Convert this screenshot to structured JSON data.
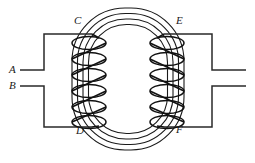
{
  "figure": {
    "type": "electrical-schematic",
    "width": 255,
    "height": 163,
    "background_color": "#ffffff",
    "line_color": "#1a1a1a"
  },
  "labels": {
    "a": "A",
    "b": "B",
    "c": "C",
    "d": "D",
    "e": "E",
    "f": "F"
  },
  "core": {
    "name": "ring-core",
    "ring_count": 4,
    "description": "four nested rounded-rectangle laminations forming a closed magnetic circuit",
    "outer": {
      "x": 72,
      "y": 8,
      "width": 112,
      "height": 142,
      "radius": 52
    },
    "ring_spacing": 5.5
  },
  "coils": {
    "primary": {
      "name": "primary-coil",
      "side": "left",
      "turns": 6,
      "top_terminal": "C",
      "bottom_terminal": "D",
      "center_x": 89,
      "top_y": 35,
      "bottom_y": 125,
      "loop_width": 34,
      "loop_height": 14
    },
    "secondary": {
      "name": "secondary-coil",
      "side": "right",
      "turns": 6,
      "top_terminal": "E",
      "bottom_terminal": "F",
      "center_x": 167,
      "top_y": 35,
      "bottom_y": 125,
      "loop_width": 34,
      "loop_height": 14
    }
  },
  "circuits": {
    "left": {
      "name": "primary-circuit-leads",
      "top_lead_label": "A",
      "bottom_lead_label": "B",
      "top_lead_y": 70,
      "bottom_lead_y": 86,
      "lead_start_x": 20,
      "corner_x": 44,
      "top_rail_y": 34,
      "bottom_rail_y": 127
    },
    "right": {
      "name": "secondary-circuit-leads",
      "top_lead_label": "",
      "bottom_lead_label": "",
      "top_lead_y": 70,
      "bottom_lead_y": 86,
      "lead_end_x": 246,
      "corner_x": 212,
      "top_rail_y": 34,
      "bottom_rail_y": 127
    }
  }
}
